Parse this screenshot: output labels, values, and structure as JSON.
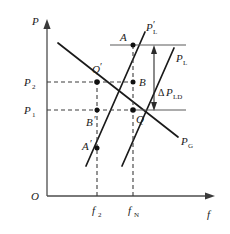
{
  "figure": {
    "kind": "line",
    "background_color": "#ffffff",
    "line_color": "#1a1a1a",
    "axis_color": "#4d4d4d",
    "guide_color": "#3d3d3d"
  },
  "axes": {
    "origin_label": "O",
    "y_axis_label": "P",
    "x_axis_label": "f",
    "y_ticks": [
      {
        "label": "P",
        "sub": "2",
        "value_y": 82
      },
      {
        "label": "P",
        "sub": "1",
        "value_y": 110
      }
    ],
    "x_ticks": [
      {
        "label": "f",
        "sub": "2",
        "value_x": 97
      },
      {
        "label": "f",
        "sub": "N",
        "value_x": 133
      }
    ]
  },
  "curves": [
    {
      "name": "load-line-shifted",
      "label": "P",
      "prime": "′",
      "sub": "L",
      "label_x": 147,
      "label_y": 28,
      "slope": "positive",
      "description": "shifted load characteristic line"
    },
    {
      "name": "load-line",
      "label": "P",
      "prime": "",
      "sub": "L",
      "label_x": 176,
      "label_y": 59,
      "slope": "positive",
      "description": "load characteristic line"
    },
    {
      "name": "generator-line",
      "label": "P",
      "prime": "",
      "sub": "G",
      "label_x": 181,
      "label_y": 142,
      "slope": "negative",
      "description": "generator droop characteristic line"
    }
  ],
  "points": [
    {
      "name": "point-a",
      "label": "A",
      "prime": "",
      "x": 133,
      "y": 45,
      "label_dx": -11,
      "label_dy": -4
    },
    {
      "name": "point-q-prime",
      "label": "Q",
      "prime": "′",
      "x": 97,
      "y": 82,
      "label_dx": -4,
      "label_dy": -9
    },
    {
      "name": "point-b",
      "label": "B",
      "prime": "",
      "x": 133,
      "y": 82,
      "label_dx": 6,
      "label_dy": 4
    },
    {
      "name": "point-q",
      "label": "Q",
      "prime": "",
      "x": 133,
      "y": 110,
      "label_dx": 3,
      "label_dy": 13
    },
    {
      "name": "point-b-prime",
      "label": "B",
      "prime": "′",
      "x": 97,
      "y": 110,
      "label_dx": -9,
      "label_dy": 16
    },
    {
      "name": "point-a-prime",
      "label": "A",
      "prime": "′",
      "x": 97,
      "y": 148,
      "label_dx": -13,
      "label_dy": 2
    }
  ],
  "annotations": [
    {
      "name": "delta-p-ld",
      "delta": "Δ",
      "label": "P",
      "sub": "LD",
      "label_x": 160,
      "label_y": 93,
      "arrow_x": 154,
      "arrow_top_y": 47,
      "arrow_bottom_y": 110,
      "description": "load power change between upper and lower reference lines"
    }
  ],
  "reference_lines": [
    {
      "name": "upper-reference-line",
      "orientation": "horizontal",
      "y": 45,
      "x_start": 110,
      "x_end": 186
    },
    {
      "name": "lower-reference-line",
      "orientation": "horizontal",
      "y": 110,
      "x_start": 133,
      "x_end": 186
    }
  ]
}
